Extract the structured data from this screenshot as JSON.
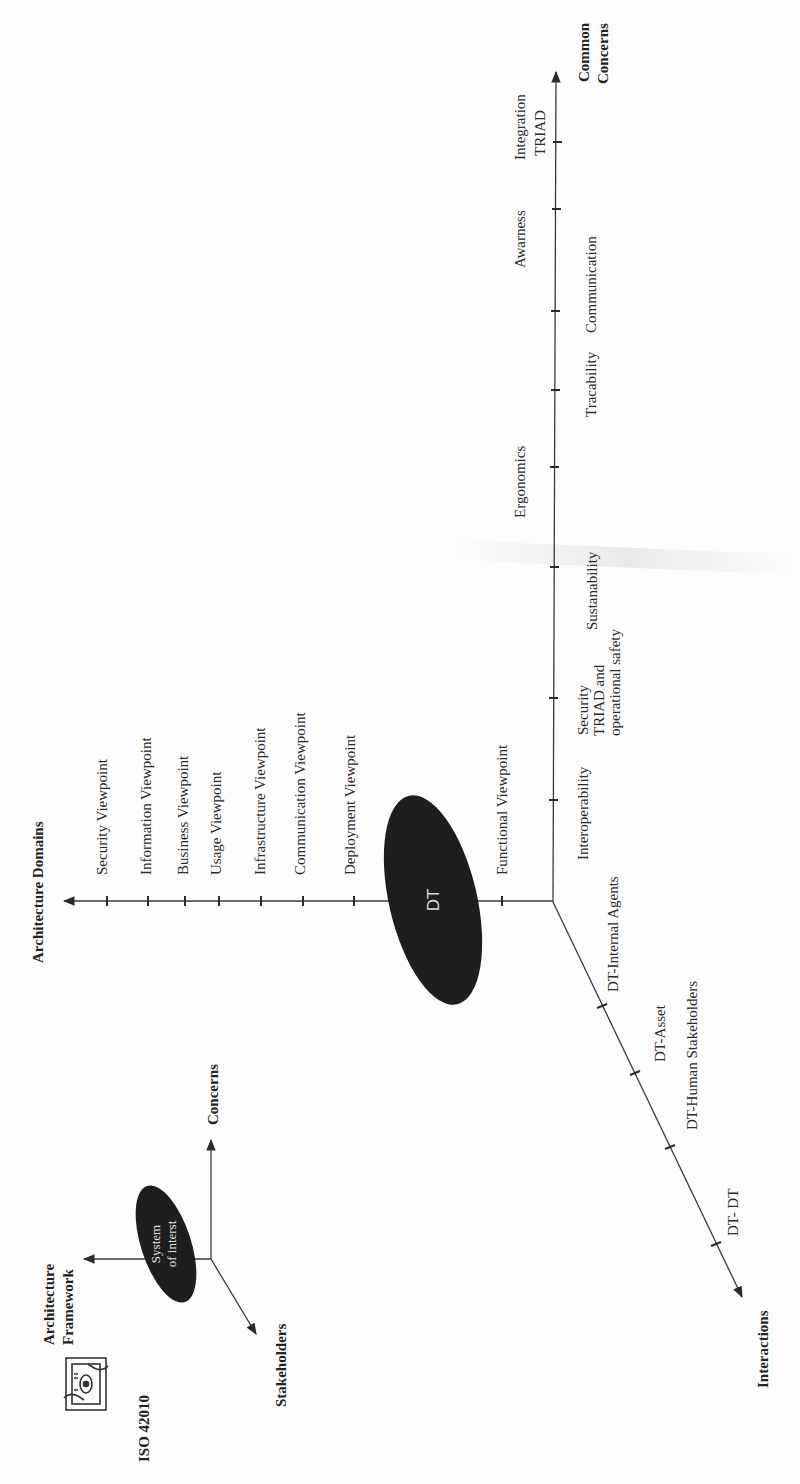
{
  "iso_framework": {
    "standard_label": "ISO 42010",
    "icon": "eye-hands-frame-icon",
    "center_label_line1": "System",
    "center_label_line2": "of interst",
    "axes": {
      "vertical_up": "Concerns",
      "horizontal_left_line1": "Architecture",
      "horizontal_left_line2": "Framework",
      "diagonal": "Stakeholders"
    }
  },
  "main_diagram": {
    "center_label": "DT",
    "architecture_domains": {
      "title": "Architecture Domains",
      "items": [
        "Security Viewpoint",
        "Information Viewpoint",
        "Business  Viewpoint",
        "Usage Viewpoint",
        "Infrastructure Viewpoint",
        "Communication  Viewpoint",
        "Deployment Viewpoint",
        "Functional  Viewpoint"
      ]
    },
    "common_concerns": {
      "title_line1": "Common",
      "title_line2": "Concerns",
      "items": [
        {
          "label": "Interoperability"
        },
        {
          "label_line1": "Security",
          "label_line2": "TRIAD and",
          "label_line3": "operational safety"
        },
        {
          "label": "Sustanability"
        },
        {
          "label": "Ergonomics"
        },
        {
          "label": "Tracability"
        },
        {
          "label": "Communication"
        },
        {
          "label": "Awarness"
        },
        {
          "label_line1": "Integration",
          "label_line2": "TRIAD"
        }
      ]
    },
    "interactions": {
      "title": "Interactions",
      "items": [
        "DT-Internal Agents",
        "DT-Asset",
        "DT-Human Stakeholders",
        "DT- DT"
      ]
    }
  },
  "colors": {
    "ellipse_fill": "#1e1e1e",
    "axis": "#3a3a3a",
    "text": "#2a2a2a",
    "background": "#fdfdfd"
  }
}
